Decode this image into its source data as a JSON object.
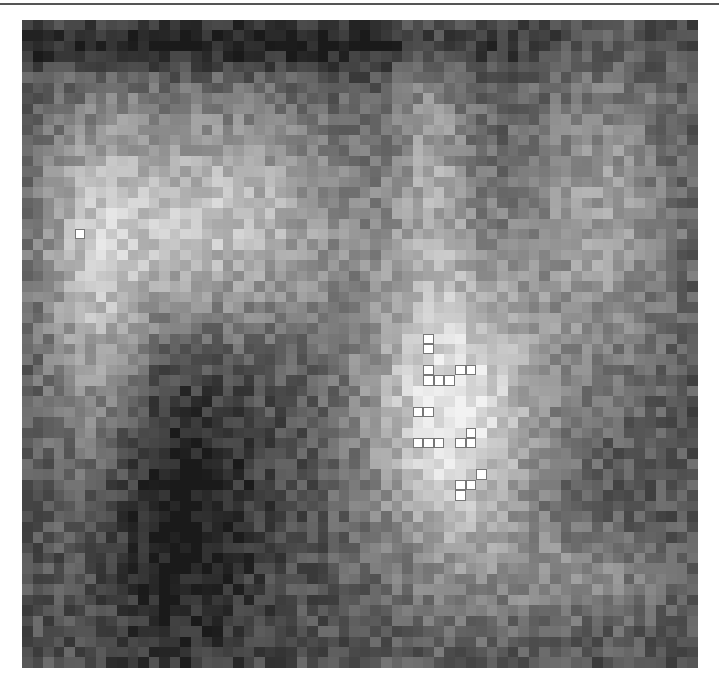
{
  "figure": {
    "type": "pixelated-grayscale-map",
    "grid": {
      "cols": 64,
      "rows": 62,
      "cell_w": 10.56,
      "cell_h": 10.45
    },
    "blobs": [
      {
        "cx": 0.27,
        "cy": 0.3,
        "rx": 0.22,
        "ry": 0.18,
        "amp": 0.45
      },
      {
        "cx": 0.1,
        "cy": 0.45,
        "rx": 0.08,
        "ry": 0.3,
        "amp": 0.3
      },
      {
        "cx": 0.63,
        "cy": 0.6,
        "rx": 0.13,
        "ry": 0.24,
        "amp": 0.6
      },
      {
        "cx": 0.6,
        "cy": 0.2,
        "rx": 0.06,
        "ry": 0.2,
        "amp": 0.25
      },
      {
        "cx": 0.85,
        "cy": 0.3,
        "rx": 0.12,
        "ry": 0.25,
        "amp": 0.3
      },
      {
        "cx": 0.82,
        "cy": 0.85,
        "rx": 0.14,
        "ry": 0.08,
        "amp": 0.2
      }
    ],
    "dark_regions": [
      {
        "cx": 0.22,
        "cy": 0.75,
        "rx": 0.12,
        "ry": 0.25,
        "amp": -0.25
      },
      {
        "cx": 0.3,
        "cy": 0.03,
        "rx": 0.5,
        "ry": 0.04,
        "amp": -0.25
      }
    ],
    "marked_cells": [
      [
        5,
        20
      ],
      [
        38,
        30
      ],
      [
        38,
        31
      ],
      [
        38,
        33
      ],
      [
        41,
        33
      ],
      [
        42,
        33
      ],
      [
        38,
        34
      ],
      [
        39,
        34
      ],
      [
        40,
        34
      ],
      [
        37,
        37
      ],
      [
        38,
        37
      ],
      [
        37,
        40
      ],
      [
        38,
        40
      ],
      [
        39,
        40
      ],
      [
        41,
        40
      ],
      [
        42,
        40
      ],
      [
        42,
        39
      ],
      [
        43,
        43
      ],
      [
        42,
        44
      ],
      [
        41,
        44
      ],
      [
        41,
        45
      ]
    ]
  }
}
